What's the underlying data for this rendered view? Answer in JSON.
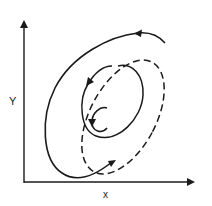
{
  "diagram": {
    "type": "phase-plane",
    "axes": {
      "x_label": "x",
      "y_label": "Y"
    },
    "curves": [
      {
        "name": "spiral-trajectory",
        "style": "solid",
        "direction": "counterclockwise-inward"
      },
      {
        "name": "limit-cycle",
        "style": "dashed",
        "direction": "counterclockwise"
      }
    ],
    "colors": {
      "stroke": "#1a1a1a",
      "background": "#ffffff"
    }
  }
}
